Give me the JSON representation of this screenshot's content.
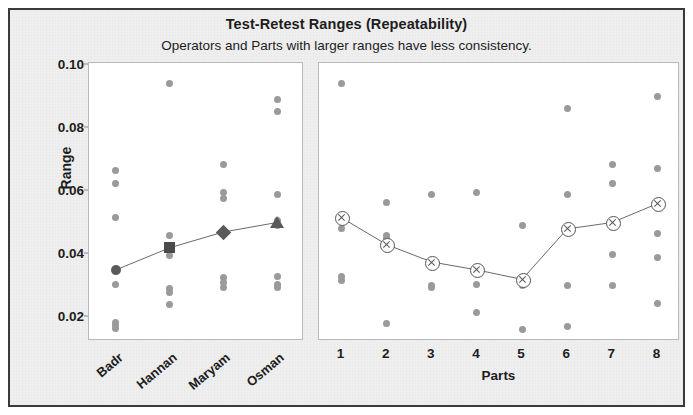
{
  "chart_title": "Test-Retest Ranges (Repeatability)",
  "chart_subtitle": "Operators and Parts with larger ranges have less consistency.",
  "y_axis": {
    "label": "Range",
    "ticks": [
      "0.02",
      "0.04",
      "0.06",
      "0.08",
      "0.10"
    ],
    "min": 0.012,
    "max": 0.1
  },
  "left_panel": {
    "axis_title": "",
    "categories": [
      "Badr",
      "Hannan",
      "Maryam",
      "Osman"
    ]
  },
  "right_panel": {
    "axis_title": "Parts",
    "categories": [
      "1",
      "2",
      "3",
      "4",
      "5",
      "6",
      "7",
      "8"
    ]
  },
  "colors": {
    "point": "#9a9a9a",
    "mean": "#555555",
    "panel_border": "#b9b9b9",
    "frame": "#3a3a3a",
    "background": "#efefef",
    "text": "#1d1d1d"
  },
  "chart_data": {
    "type": "scatter",
    "title": "Test-Retest Ranges (Repeatability)",
    "subtitle": "Operators and Parts with larger ranges have less consistency.",
    "ylabel": "Range",
    "ylim": [
      0.012,
      0.1
    ],
    "grid": false,
    "legend": "none",
    "panels": [
      {
        "name": "Operators",
        "xlabel": "",
        "categories": [
          "Badr",
          "Hannan",
          "Maryam",
          "Osman"
        ],
        "mean_marker_shapes": [
          "circle",
          "square",
          "diamond",
          "triangle"
        ],
        "means": [
          0.035,
          0.042,
          0.047,
          0.05
        ],
        "points": [
          [
            0.0665,
            0.0625,
            0.0515,
            0.0345,
            0.0305,
            0.0185,
            0.0175,
            0.0165
          ],
          [
            0.094,
            0.046,
            0.0425,
            0.0395,
            0.029,
            0.028,
            0.024
          ],
          [
            0.0685,
            0.0595,
            0.0575,
            0.047,
            0.0325,
            0.031,
            0.0295
          ],
          [
            0.089,
            0.085,
            0.059,
            0.0505,
            0.049,
            0.033,
            0.0305,
            0.0295
          ]
        ]
      },
      {
        "name": "Parts",
        "xlabel": "Parts",
        "categories": [
          "1",
          "2",
          "3",
          "4",
          "5",
          "6",
          "7",
          "8"
        ],
        "mean_marker_shapes": [
          "circlex",
          "circlex",
          "circlex",
          "circlex",
          "circlex",
          "circlex",
          "circlex",
          "circlex"
        ],
        "means": [
          0.0515,
          0.043,
          0.0375,
          0.035,
          0.032,
          0.048,
          0.05,
          0.056
        ],
        "points": [
          [
            0.094,
            0.0515,
            0.048,
            0.033,
            0.0315
          ],
          [
            0.0565,
            0.046,
            0.045,
            0.043,
            0.018
          ],
          [
            0.059,
            0.0375,
            0.03,
            0.0295
          ],
          [
            0.0595,
            0.035,
            0.0305,
            0.0215
          ],
          [
            0.049,
            0.0325,
            0.031,
            0.03,
            0.016
          ],
          [
            0.086,
            0.059,
            0.048,
            0.03,
            0.017
          ],
          [
            0.0685,
            0.0625,
            0.05,
            0.04,
            0.03
          ],
          [
            0.09,
            0.067,
            0.056,
            0.0465,
            0.039,
            0.0245
          ]
        ]
      }
    ]
  }
}
